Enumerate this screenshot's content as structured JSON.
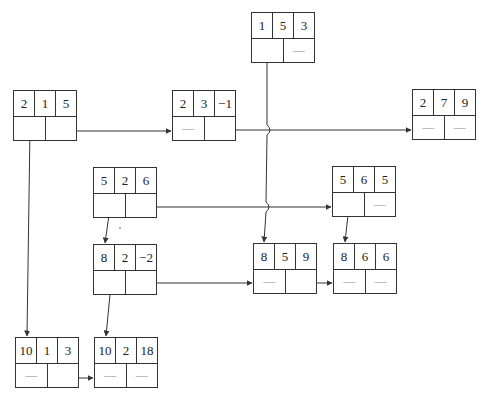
{
  "nodes": [
    {
      "id": "n215",
      "x": 13,
      "y": 90,
      "info": [
        "2",
        "1",
        "5"
      ],
      "ptr": [
        "",
        ""
      ]
    },
    {
      "id": "n23m1",
      "x": 172,
      "y": 90,
      "info": [
        "2",
        "3",
        "−1"
      ],
      "ptr": [
        "—",
        ""
      ]
    },
    {
      "id": "n153",
      "x": 251,
      "y": 12,
      "info": [
        "1",
        "5",
        "3"
      ],
      "ptr": [
        "",
        "—"
      ]
    },
    {
      "id": "n279",
      "x": 412,
      "y": 89,
      "info": [
        "2",
        "7",
        "9"
      ],
      "ptr": [
        "—",
        "—"
      ]
    },
    {
      "id": "n526",
      "x": 93,
      "y": 167,
      "info": [
        "5",
        "2",
        "6"
      ],
      "ptr": [
        "",
        ""
      ]
    },
    {
      "id": "n565",
      "x": 332,
      "y": 166,
      "info": [
        "5",
        "6",
        "5"
      ],
      "ptr": [
        "",
        "—"
      ]
    },
    {
      "id": "n82m2",
      "x": 93,
      "y": 244,
      "info": [
        "8",
        "2",
        "−2"
      ],
      "ptr": [
        "",
        ""
      ]
    },
    {
      "id": "n859",
      "x": 253,
      "y": 243,
      "info": [
        "8",
        "5",
        "9"
      ],
      "ptr": [
        "—",
        ""
      ]
    },
    {
      "id": "n866",
      "x": 333,
      "y": 243,
      "info": [
        "8",
        "6",
        "6"
      ],
      "ptr": [
        "—",
        "—"
      ]
    },
    {
      "id": "n1013",
      "x": 15,
      "y": 337,
      "info": [
        "10",
        "1",
        "3"
      ],
      "ptr": [
        "—",
        ""
      ]
    },
    {
      "id": "n10218",
      "x": 94,
      "y": 337,
      "info": [
        "10",
        "2",
        "18"
      ],
      "ptr": [
        "—",
        "—"
      ]
    }
  ],
  "edges": [
    {
      "from": "2,1,5",
      "to": "2,3,-1",
      "kind": "right"
    },
    {
      "from": "2,1,5",
      "to": "10,1,3",
      "kind": "down"
    },
    {
      "from": "2,3,-1",
      "to": "2,7,9",
      "kind": "right"
    },
    {
      "from": "1,5,3",
      "to": "8,5,9",
      "kind": "down"
    },
    {
      "from": "5,2,6",
      "to": "5,6,5",
      "kind": "right"
    },
    {
      "from": "5,2,6",
      "to": "8,2,-2",
      "kind": "down"
    },
    {
      "from": "5,6,5",
      "to": "8,6,6",
      "kind": "down"
    },
    {
      "from": "8,2,-2",
      "to": "8,5,9",
      "kind": "right"
    },
    {
      "from": "8,2,-2",
      "to": "10,2,18",
      "kind": "down"
    },
    {
      "from": "8,5,9",
      "to": "8,6,6",
      "kind": "right"
    },
    {
      "from": "10,1,3",
      "to": "10,2,18",
      "kind": "right"
    }
  ],
  "colors": {
    "line": "#333333",
    "dash": "#888888"
  }
}
